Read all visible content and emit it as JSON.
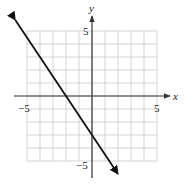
{
  "chart_data": {
    "type": "line",
    "title": "",
    "xlabel": "x",
    "ylabel": "y",
    "xlim": [
      -5,
      5
    ],
    "ylim": [
      -5,
      5
    ],
    "grid": true,
    "grid_step": 1,
    "tick_labels": {
      "x": [
        {
          "value": -5,
          "label": "−5"
        },
        {
          "value": 5,
          "label": "5"
        }
      ],
      "y": [
        {
          "value": 5,
          "label": "5"
        },
        {
          "value": -5,
          "label": "−5"
        }
      ]
    },
    "series": [
      {
        "name": "line",
        "equation": "y = -1.5x - 3",
        "slope": -1.5,
        "y_intercept": -3,
        "x_intercept": -2,
        "x": [
          -5.9,
          2.0
        ],
        "y": [
          5.85,
          -6.0
        ],
        "arrows_both_ends": true,
        "color": "#111111"
      }
    ],
    "legend": null
  },
  "labels": {
    "x_axis": "x",
    "y_axis": "y",
    "x_min": "−5",
    "x_max": "5",
    "y_max": "5",
    "y_min": "−5"
  },
  "colors": {
    "grid": "#c8c8c8",
    "axis": "#333333",
    "line": "#111111"
  }
}
